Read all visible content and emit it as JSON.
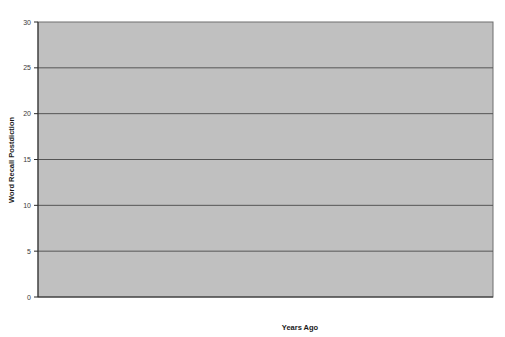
{
  "chart_data": {
    "type": "line",
    "title": "",
    "subtitle": "",
    "xlabel": "Years Ago",
    "ylabel": "Word Recall Postdiction",
    "categories": [
      "9",
      "6",
      "3",
      "0"
    ],
    "x": [
      9,
      6,
      3,
      0
    ],
    "xlim": [
      9.6,
      -0.6
    ],
    "ylim": [
      0,
      30
    ],
    "yticks": [
      0,
      5,
      10,
      15,
      20,
      25,
      30
    ],
    "xticks": [
      9,
      6,
      3,
      0
    ],
    "grid": "horizontal",
    "legend": "none",
    "annotations": [],
    "plot_bgcolor": "#c0c0c0",
    "figure_bgcolor": "#ffffff",
    "line_color": "#1a1a1a",
    "marker_color": "#1a1a1a",
    "marker_shapes": [
      "square",
      "diamond",
      "triangle"
    ],
    "n_series": 62,
    "series": [
      {
        "name": "s1",
        "marker": "square",
        "values": [
          30.0,
          25.0,
          22.0,
          24.0
        ]
      },
      {
        "name": "s2",
        "marker": "square",
        "values": [
          29.0,
          27.5,
          26.5,
          30.0
        ]
      },
      {
        "name": "s3",
        "marker": "square",
        "values": [
          28.5,
          24.0,
          21.0,
          27.5
        ]
      },
      {
        "name": "s4",
        "marker": "square",
        "values": [
          28.0,
          26.0,
          28.5,
          26.0
        ]
      },
      {
        "name": "s5",
        "marker": "square",
        "values": [
          27.5,
          22.5,
          25.0,
          23.0
        ]
      },
      {
        "name": "s6",
        "marker": "square",
        "values": [
          27.0,
          25.5,
          20.0,
          25.5
        ]
      },
      {
        "name": "s7",
        "marker": "square",
        "values": [
          26.5,
          21.0,
          24.0,
          28.0
        ]
      },
      {
        "name": "s8",
        "marker": "square",
        "values": [
          26.0,
          26.5,
          22.5,
          21.0
        ]
      },
      {
        "name": "s9",
        "marker": "square",
        "values": [
          25.5,
          20.0,
          27.0,
          24.5
        ]
      },
      {
        "name": "s10",
        "marker": "square",
        "values": [
          25.0,
          24.5,
          19.0,
          22.0
        ]
      },
      {
        "name": "s11",
        "marker": "square",
        "values": [
          25.0,
          27.0,
          23.5,
          26.5
        ]
      },
      {
        "name": "s12",
        "marker": "square",
        "values": [
          24.5,
          22.0,
          21.5,
          19.5
        ]
      },
      {
        "name": "s13",
        "marker": "square",
        "values": [
          24.0,
          25.0,
          25.5,
          23.5
        ]
      },
      {
        "name": "s14",
        "marker": "square",
        "values": [
          24.0,
          19.5,
          18.0,
          20.5
        ]
      },
      {
        "name": "s15",
        "marker": "square",
        "values": [
          23.5,
          23.0,
          24.5,
          27.0
        ]
      },
      {
        "name": "s16",
        "marker": "square",
        "values": [
          23.0,
          26.0,
          20.5,
          18.5
        ]
      },
      {
        "name": "s17",
        "marker": "square",
        "values": [
          23.0,
          21.5,
          22.0,
          25.0
        ]
      },
      {
        "name": "s18",
        "marker": "diamond",
        "values": [
          22.5,
          24.0,
          26.0,
          22.5
        ]
      },
      {
        "name": "s19",
        "marker": "square",
        "values": [
          22.0,
          20.5,
          19.5,
          24.0
        ]
      },
      {
        "name": "s20",
        "marker": "square",
        "values": [
          22.0,
          23.5,
          23.0,
          20.0
        ]
      },
      {
        "name": "s21",
        "marker": "square",
        "values": [
          21.5,
          25.5,
          21.0,
          26.0
        ]
      },
      {
        "name": "s22",
        "marker": "square",
        "values": [
          21.0,
          18.5,
          24.0,
          21.5
        ]
      },
      {
        "name": "s23",
        "marker": "square",
        "values": [
          21.0,
          22.0,
          20.0,
          23.0
        ]
      },
      {
        "name": "s24",
        "marker": "diamond",
        "values": [
          20.5,
          24.5,
          22.5,
          17.5
        ]
      },
      {
        "name": "s25",
        "marker": "square",
        "values": [
          20.0,
          20.0,
          18.5,
          25.5
        ]
      },
      {
        "name": "s26",
        "marker": "square",
        "values": [
          20.0,
          23.0,
          25.0,
          19.0
        ]
      },
      {
        "name": "s27",
        "marker": "square",
        "values": [
          19.5,
          17.5,
          21.5,
          22.0
        ]
      },
      {
        "name": "s28",
        "marker": "square",
        "values": [
          19.0,
          21.0,
          19.0,
          20.5
        ]
      },
      {
        "name": "s29",
        "marker": "square",
        "values": [
          19.0,
          25.0,
          23.5,
          24.5
        ]
      },
      {
        "name": "s30",
        "marker": "square",
        "values": [
          18.5,
          19.0,
          17.0,
          18.0
        ]
      },
      {
        "name": "s31",
        "marker": "square",
        "values": [
          18.0,
          22.5,
          20.5,
          21.0
        ]
      },
      {
        "name": "s32",
        "marker": "square",
        "values": [
          17.5,
          16.5,
          22.0,
          23.5
        ]
      },
      {
        "name": "s33",
        "marker": "square",
        "values": [
          17.0,
          20.0,
          18.0,
          16.5
        ]
      },
      {
        "name": "s34",
        "marker": "square",
        "values": [
          16.5,
          23.5,
          21.0,
          19.5
        ]
      },
      {
        "name": "s35",
        "marker": "square",
        "values": [
          16.0,
          18.0,
          15.5,
          22.0
        ]
      },
      {
        "name": "s36",
        "marker": "square",
        "values": [
          16.0,
          21.5,
          24.0,
          17.0
        ]
      },
      {
        "name": "s37",
        "marker": "square",
        "values": [
          15.5,
          15.0,
          19.0,
          20.0
        ]
      },
      {
        "name": "s38",
        "marker": "square",
        "values": [
          15.0,
          19.5,
          16.5,
          15.5
        ]
      },
      {
        "name": "s39",
        "marker": "square",
        "values": [
          15.0,
          17.0,
          20.5,
          21.5
        ]
      },
      {
        "name": "s40",
        "marker": "square",
        "values": [
          14.5,
          22.0,
          14.5,
          18.0
        ]
      },
      {
        "name": "s41",
        "marker": "diamond",
        "values": [
          14.0,
          16.0,
          18.5,
          14.0
        ]
      },
      {
        "name": "s42",
        "marker": "square",
        "values": [
          13.5,
          20.0,
          17.5,
          19.0
        ]
      },
      {
        "name": "s43",
        "marker": "diamond",
        "values": [
          13.0,
          14.0,
          13.5,
          16.0
        ]
      },
      {
        "name": "s44",
        "marker": "square",
        "values": [
          12.5,
          18.0,
          21.0,
          13.0
        ]
      },
      {
        "name": "s45",
        "marker": "square",
        "values": [
          12.0,
          15.5,
          16.0,
          17.5
        ]
      },
      {
        "name": "s46",
        "marker": "diamond",
        "values": [
          11.5,
          13.0,
          19.5,
          12.0
        ]
      },
      {
        "name": "s47",
        "marker": "square",
        "values": [
          11.0,
          17.0,
          12.5,
          15.0
        ]
      },
      {
        "name": "s48",
        "marker": "triangle",
        "values": [
          10.5,
          11.5,
          15.0,
          20.0
        ]
      },
      {
        "name": "s49",
        "marker": "square",
        "values": [
          10.5,
          19.0,
          17.0,
          11.0
        ]
      },
      {
        "name": "s50",
        "marker": "square",
        "values": [
          10.0,
          10.5,
          14.0,
          16.5
        ]
      },
      {
        "name": "s51",
        "marker": "square",
        "values": [
          10.0,
          16.0,
          18.0,
          22.0
        ]
      },
      {
        "name": "s52",
        "marker": "triangle",
        "values": [
          9.5,
          12.0,
          11.0,
          10.5
        ]
      },
      {
        "name": "s53",
        "marker": "square",
        "values": [
          9.0,
          14.5,
          16.0,
          13.5
        ]
      },
      {
        "name": "s54",
        "marker": "triangle",
        "values": [
          8.0,
          10.0,
          13.0,
          9.0
        ]
      },
      {
        "name": "s55",
        "marker": "square",
        "values": [
          7.5,
          13.5,
          15.5,
          17.0
        ]
      },
      {
        "name": "s56",
        "marker": "square",
        "values": [
          7.0,
          9.5,
          10.0,
          6.5
        ]
      },
      {
        "name": "s57",
        "marker": "triangle",
        "values": [
          6.5,
          11.0,
          14.0,
          12.0
        ]
      },
      {
        "name": "s58",
        "marker": "square",
        "values": [
          5.0,
          5.0,
          5.5,
          6.5
        ]
      },
      {
        "name": "s59",
        "marker": "square",
        "values": [
          5.0,
          8.0,
          9.0,
          4.0
        ]
      },
      {
        "name": "s60",
        "marker": "square",
        "values": [
          0.0,
          0.0,
          10.5,
          21.0
        ]
      },
      {
        "name": "s61",
        "marker": "square",
        "values": [
          21.5,
          19.0,
          26.0,
          28.5
        ]
      },
      {
        "name": "s62",
        "marker": "square",
        "values": [
          26.5,
          28.0,
          24.5,
          20.0
        ]
      }
    ]
  },
  "axis": {
    "ylabel": "Word Recall Postdiction",
    "xlabel": "Years Ago",
    "ytick_labels": [
      "30",
      "25",
      "20",
      "15",
      "10",
      "5",
      "0"
    ],
    "xtick_labels": [
      "9",
      "6",
      "3",
      "0"
    ]
  }
}
